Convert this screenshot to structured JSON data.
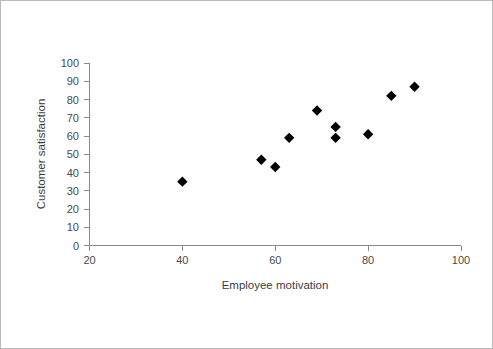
{
  "chart_data": {
    "type": "scatter",
    "title": "",
    "xlabel": "Employee motivation",
    "ylabel": "Customer satisfaction",
    "xlim": [
      20,
      100
    ],
    "ylim": [
      0,
      100
    ],
    "xticks": [
      20,
      40,
      60,
      80,
      100
    ],
    "yticks": [
      0,
      10,
      20,
      30,
      40,
      50,
      60,
      70,
      80,
      90,
      100
    ],
    "grid": false,
    "legend": false,
    "marker": "diamond",
    "marker_color": "#000000",
    "x": [
      40,
      57,
      60,
      63,
      69,
      73,
      73,
      80,
      85,
      90
    ],
    "y": [
      35,
      47,
      43,
      59,
      74,
      65,
      59,
      61,
      82,
      87
    ],
    "points": [
      {
        "x": 40,
        "y": 35
      },
      {
        "x": 57,
        "y": 47
      },
      {
        "x": 60,
        "y": 43
      },
      {
        "x": 63,
        "y": 59
      },
      {
        "x": 69,
        "y": 74
      },
      {
        "x": 73,
        "y": 65
      },
      {
        "x": 73,
        "y": 59
      },
      {
        "x": 80,
        "y": 61
      },
      {
        "x": 85,
        "y": 82
      },
      {
        "x": 90,
        "y": 87
      }
    ]
  },
  "axes": {
    "x_tick_labels": [
      "20",
      "40",
      "60",
      "80",
      "100"
    ],
    "y_tick_labels": [
      "0",
      "10",
      "20",
      "30",
      "40",
      "50",
      "60",
      "70",
      "80",
      "90",
      "100"
    ],
    "x_title": "Employee motivation",
    "y_title": "Customer satisfaction"
  },
  "colors": {
    "marker": "#000000",
    "axis": "#8a8a8a",
    "text": "#4a4a4a",
    "border": "#b9b9b9",
    "background": "#ffffff"
  }
}
